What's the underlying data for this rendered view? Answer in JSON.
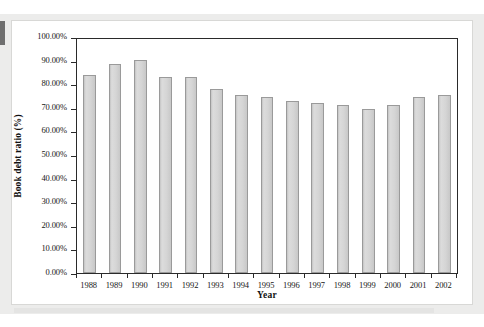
{
  "figure": {
    "panel_background": "#ffffff",
    "page_background": "#ececeb",
    "axis_color": "#2a2a2a",
    "bar_fill": "#d2d2d2",
    "bar_border": "#9a9a9a"
  },
  "chart_data": {
    "type": "bar",
    "title": "",
    "xlabel": "Year",
    "ylabel": "Book debt ratio (%)",
    "categories": [
      "1988",
      "1989",
      "1990",
      "1991",
      "1992",
      "1993",
      "1994",
      "1995",
      "1996",
      "1997",
      "1998",
      "1999",
      "2000",
      "2001",
      "2002"
    ],
    "values": [
      84.5,
      89.0,
      90.5,
      83.5,
      83.5,
      78.4,
      76.0,
      75.0,
      73.2,
      72.4,
      71.6,
      70.1,
      71.6,
      75.1,
      76.0
    ],
    "ylim": [
      0,
      100
    ],
    "ytick_labels": [
      "0.00%",
      "10.00%",
      "20.00%",
      "30.00%",
      "40.00%",
      "50.00%",
      "60.00%",
      "70.00%",
      "80.00%",
      "90.00%",
      "100.00%"
    ],
    "ytick_values": [
      0,
      10,
      20,
      30,
      40,
      50,
      60,
      70,
      80,
      90,
      100
    ],
    "grid": false,
    "legend": null,
    "legend_position": "none",
    "series": [
      {
        "name": "Book debt ratio",
        "values": [
          84.5,
          89.0,
          90.5,
          83.5,
          83.5,
          78.4,
          76.0,
          75.0,
          73.2,
          72.4,
          71.6,
          70.1,
          71.6,
          75.1,
          76.0
        ]
      }
    ]
  }
}
